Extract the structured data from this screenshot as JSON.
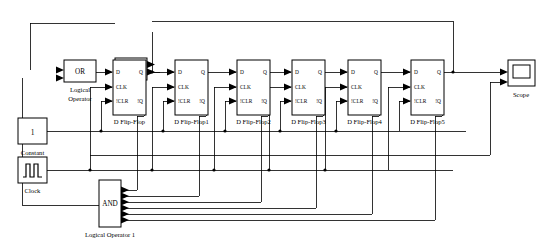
{
  "diagram": {
    "background": "#ffffff",
    "line_color": "#000000",
    "width": 545,
    "height": 242
  },
  "blocks": {
    "constant": {
      "label": "Constant",
      "value": "1",
      "icon": "constant-block-icon"
    },
    "clock": {
      "label": "Clock",
      "icon": "pulse-wave-icon"
    },
    "scope": {
      "label": "Scope",
      "icon": "scope-screen-icon",
      "input_count": 2
    },
    "logic_or": {
      "symbol": "OR",
      "label_line1": "Logical",
      "label_line2": "Operator",
      "input_count": 2
    },
    "logic_xor": {
      "symbol": "XOR",
      "label_line1": "Logical",
      "label_line2": "Operator 2",
      "input_count": 2
    },
    "logic_and": {
      "symbol": "AND",
      "label": "Logical Operator 1",
      "input_count": 6
    }
  },
  "flipflop_ports": {
    "d": "D",
    "clk": "CLK",
    "clr": "!CLR",
    "q": "Q",
    "qbar": "!Q"
  },
  "flipflops": [
    {
      "name": "D Flip-Flop",
      "x": 113
    },
    {
      "name": "D Flip-Flop1",
      "x": 175
    },
    {
      "name": "D Flip-Flop2",
      "x": 237
    },
    {
      "name": "D Flip-Flop3",
      "x": 292
    },
    {
      "name": "D Flip-Flop4",
      "x": 348
    },
    {
      "name": "D Flip-Flop5",
      "x": 411
    }
  ]
}
